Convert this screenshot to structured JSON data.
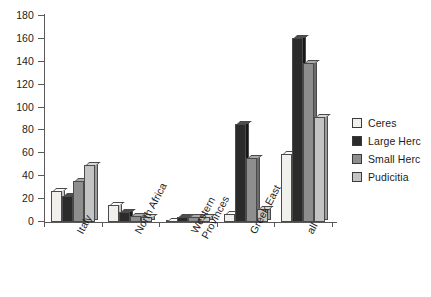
{
  "chart_data": {
    "type": "bar",
    "title": "",
    "xlabel": "",
    "ylabel": "",
    "ylim": [
      0,
      180
    ],
    "ytick_step": 20,
    "yticks": [
      180,
      160,
      140,
      120,
      100,
      80,
      60,
      40,
      20,
      0
    ],
    "grid": false,
    "legend_position": "right",
    "categories": [
      "Italy",
      "North Africa",
      "Western Provinces",
      "Greek East",
      "all"
    ],
    "series": [
      {
        "name": "Ceres",
        "color": "#f2f0ec",
        "values": [
          27,
          15,
          1,
          7,
          59
        ]
      },
      {
        "name": "Large Herc",
        "color": "#2b2b2b",
        "values": [
          23,
          9,
          4,
          86,
          161
        ]
      },
      {
        "name": "Small Herc",
        "color": "#8e8e8e",
        "values": [
          36,
          5,
          4,
          56,
          139
        ]
      },
      {
        "name": "Pudicitia",
        "color": "#c4c4c4",
        "values": [
          50,
          4,
          4,
          11,
          92
        ]
      }
    ]
  },
  "axis": {
    "y_tick_labels": [
      "180",
      "160",
      "140",
      "120",
      "100",
      "80",
      "60",
      "40",
      "20",
      "0"
    ],
    "x_tick_labels": [
      "Italy",
      "North Africa",
      "Western Provinces",
      "Greek East",
      "all"
    ]
  },
  "legend": {
    "items": [
      {
        "label": "Ceres"
      },
      {
        "label": "Large Herc"
      },
      {
        "label": "Small Herc"
      },
      {
        "label": "Pudicitia"
      }
    ]
  }
}
